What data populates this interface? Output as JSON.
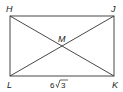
{
  "diagram": {
    "type": "rectangle-with-diagonals",
    "vertices": {
      "H": {
        "label": "H",
        "x": 10,
        "y": 16
      },
      "J": {
        "label": "J",
        "x": 114,
        "y": 16
      },
      "K": {
        "label": "K",
        "x": 114,
        "y": 76
      },
      "L": {
        "label": "L",
        "x": 10,
        "y": 76
      }
    },
    "intersection": {
      "label": "M",
      "x": 62,
      "y": 46
    },
    "measurements": {
      "LK": {
        "value": "6",
        "radical": "3",
        "text": "6√3"
      }
    },
    "colors": {
      "stroke": "#333333",
      "text": "#222222",
      "background": "#ffffff"
    }
  }
}
